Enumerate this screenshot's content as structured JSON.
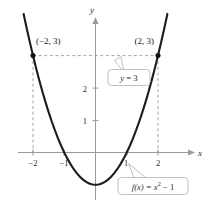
{
  "figure": {
    "name": "parabola-graph",
    "background_color": "#ffffff",
    "curve_color": "#1c1c1c",
    "axis_color": "#9a9a9a",
    "dash_color": "#9a9a9a"
  },
  "chart_data": {
    "type": "line",
    "title": "",
    "xlabel": "x",
    "ylabel": "y",
    "xlim": [
      -2.5,
      2.6
    ],
    "ylim": [
      -1.6,
      4.0
    ],
    "grid": false,
    "legend": "none",
    "series": [
      {
        "name": "f(x) = x^2 - 1",
        "expression": "x^2 - 1",
        "x": [
          -2.3,
          -2.2,
          -2.1,
          -2.0,
          -1.9,
          -1.8,
          -1.7,
          -1.6,
          -1.5,
          -1.4,
          -1.3,
          -1.2,
          -1.1,
          -1.0,
          -0.9,
          -0.8,
          -0.7,
          -0.6,
          -0.5,
          -0.4,
          -0.3,
          -0.2,
          -0.1,
          0.0,
          0.1,
          0.2,
          0.3,
          0.4,
          0.5,
          0.6,
          0.7,
          0.8,
          0.9,
          1.0,
          1.1,
          1.2,
          1.3,
          1.4,
          1.5,
          1.6,
          1.7,
          1.8,
          1.9,
          2.0,
          2.1,
          2.2,
          2.3
        ],
        "values": [
          4.29,
          3.84,
          3.41,
          3.0,
          2.61,
          2.24,
          1.89,
          1.56,
          1.25,
          0.96,
          0.69,
          0.44,
          0.21,
          0.0,
          -0.19,
          -0.36,
          -0.51,
          -0.64,
          -0.75,
          -0.84,
          -0.91,
          -0.96,
          -0.99,
          -1.0,
          -0.99,
          -0.96,
          -0.91,
          -0.84,
          -0.75,
          -0.64,
          -0.51,
          -0.36,
          -0.19,
          0.0,
          0.21,
          0.44,
          0.69,
          0.96,
          1.25,
          1.56,
          1.89,
          2.24,
          2.61,
          3.0,
          3.41,
          3.84,
          4.29
        ]
      },
      {
        "name": "y = 3",
        "type": "horizontal-dashed",
        "value": 3,
        "x_from": -2,
        "x_to": 2
      }
    ],
    "points": [
      {
        "label": "(−2, 3)",
        "x": -2,
        "y": 3
      },
      {
        "label": "(2, 3)",
        "x": 2,
        "y": 3
      }
    ],
    "xticks": [
      -2,
      -1,
      1,
      2
    ],
    "xtick_labels": [
      "−2",
      "−1",
      "1",
      "2"
    ],
    "yticks": [
      1,
      2
    ],
    "ytick_labels": [
      "1",
      "2"
    ],
    "annotations": [
      {
        "name": "y-equals-3-callout",
        "text_prefix": "y",
        "text_rest": " = 3",
        "full_text": "y = 3",
        "points_to": "horizontal dashed line y = 3"
      },
      {
        "name": "function-callout",
        "text_prefix": "f",
        "text_rest": "(x) = x² − 1",
        "full_text": "f(x) = x² − 1",
        "points_to": "parabola near x = 1"
      }
    ],
    "vertical_dashed": [
      {
        "x": -2,
        "y_from": 0,
        "y_to": 3
      },
      {
        "x": 2,
        "y_from": 0,
        "y_to": 3
      }
    ]
  },
  "labels": {
    "y_axis": "y",
    "x_axis": "x",
    "left_point": "(−2, 3)",
    "right_point": "(2, 3)",
    "callout_line": "y = 3",
    "callout_function": "f(x) = x² − 1",
    "callout_function_f": "f",
    "callout_function_rest": "(x) = x",
    "callout_function_exp": "2",
    "callout_function_tail": " − 1",
    "callout_line_y": "y",
    "callout_line_rest": " = 3",
    "tick_x_neg2": "−2",
    "tick_x_neg1": "−1",
    "tick_x_1": "1",
    "tick_x_2": "2",
    "tick_y_1": "1",
    "tick_y_2": "2"
  }
}
